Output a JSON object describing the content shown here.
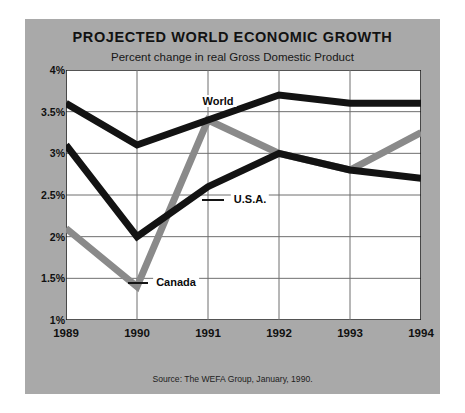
{
  "card": {
    "background_color": "#a9a9a9",
    "plot_background_color": "#ffffff"
  },
  "header": {
    "title": "PROJECTED WORLD ECONOMIC GROWTH",
    "subtitle": "Percent change in real Gross Domestic Product"
  },
  "footer": {
    "source": "Source: The WEFA Group, January, 1990."
  },
  "axes": {
    "y_ticks": [
      "4%",
      "3.5%",
      "3%",
      "2.5%",
      "2%",
      "1.5%",
      "1%"
    ],
    "x_ticks": [
      "1989",
      "1990",
      "1991",
      "1992",
      "1993",
      "1994"
    ]
  },
  "annotations": {
    "world": "World",
    "usa": "U.S.A.",
    "canada": "Canada"
  },
  "chart_data": {
    "type": "line",
    "title": "PROJECTED WORLD ECONOMIC GROWTH",
    "subtitle": "Percent change in real Gross Domestic Product",
    "xlabel": "",
    "ylabel": "Percent change in real Gross Domestic Product",
    "x": [
      1989,
      1990,
      1991,
      1992,
      1993,
      1994
    ],
    "categories": [
      "1989",
      "1990",
      "1991",
      "1992",
      "1993",
      "1994"
    ],
    "ylim": [
      1,
      4
    ],
    "xlim": [
      1989,
      1994
    ],
    "ytick_values": [
      4,
      3.5,
      3,
      2.5,
      2,
      1.5,
      1
    ],
    "ytick_labels": [
      "4%",
      "3.5%",
      "3%",
      "2.5%",
      "2%",
      "1.5%",
      "1%"
    ],
    "grid": true,
    "legend": "inline-annotations",
    "minor_ticks_y": true,
    "series": [
      {
        "name": "World",
        "color": "#131313",
        "width": 7,
        "values": [
          3.6,
          3.1,
          3.4,
          3.7,
          3.6,
          3.6
        ]
      },
      {
        "name": "U.S.A.",
        "color": "#131313",
        "width": 7,
        "values": [
          3.1,
          2.0,
          2.6,
          3.0,
          2.8,
          2.7
        ]
      },
      {
        "name": "Canada",
        "color": "#8a8a8a",
        "width": 7,
        "values": [
          2.1,
          1.4,
          3.4,
          3.0,
          2.8,
          3.25
        ]
      }
    ],
    "source": "Source: The WEFA Group, January, 1990."
  }
}
